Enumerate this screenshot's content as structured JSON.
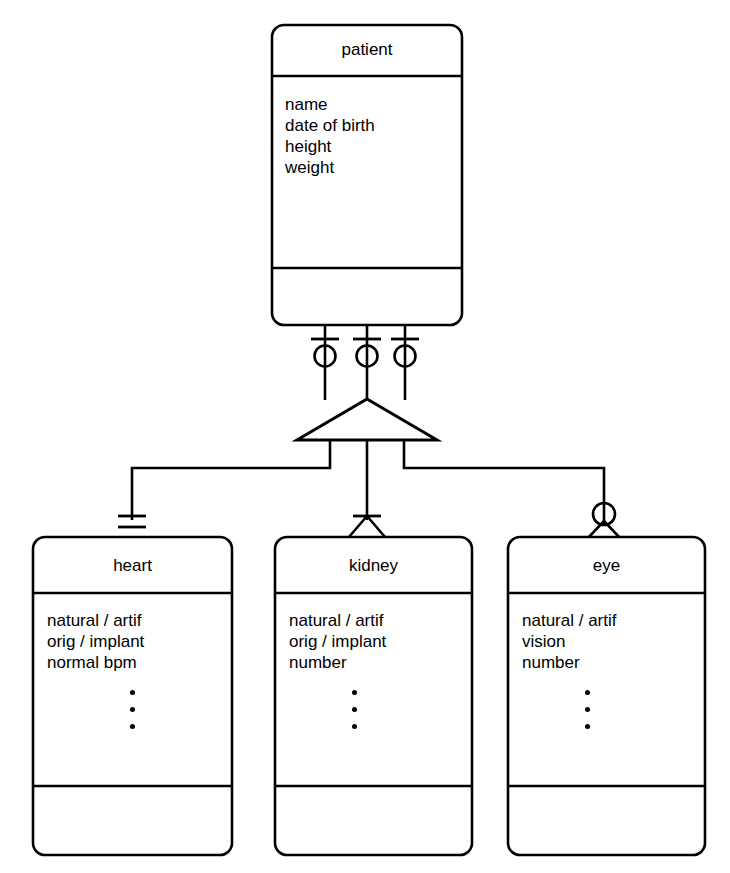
{
  "diagram": {
    "notation": "crow's foot with generalization category triangle",
    "stroke_color": "#000000",
    "background_color": "#ffffff"
  },
  "parent_entity": {
    "name": "patient",
    "attributes": [
      "name",
      "date of birth",
      "height",
      "weight"
    ],
    "has_empty_footer_compartment": true
  },
  "child_entities": [
    {
      "name": "heart",
      "attributes": [
        "natural / artif",
        "orig / implant",
        "normal bpm"
      ],
      "ellipsis": "⋮",
      "has_empty_footer_compartment": true,
      "cardinality_symbol": "one-and-only-one-double-bar"
    },
    {
      "name": "kidney",
      "attributes": [
        "natural / artif",
        "orig / implant",
        "number"
      ],
      "ellipsis": "⋮",
      "has_empty_footer_compartment": true,
      "cardinality_symbol": "one-or-more-bar-crowsfoot"
    },
    {
      "name": "eye",
      "attributes": [
        "natural / artif",
        "vision",
        "number"
      ],
      "ellipsis": "⋮",
      "has_empty_footer_compartment": true,
      "cardinality_symbol": "zero-or-more-circle-crowsfoot"
    }
  ],
  "parent_connectors": [
    {
      "symbol": "zero-or-one-bar-circle"
    },
    {
      "symbol": "zero-or-one-bar-circle"
    },
    {
      "symbol": "zero-or-one-bar-circle"
    }
  ],
  "category_symbol": {
    "shape": "triangle",
    "meaning": "generalization / category discriminator"
  }
}
